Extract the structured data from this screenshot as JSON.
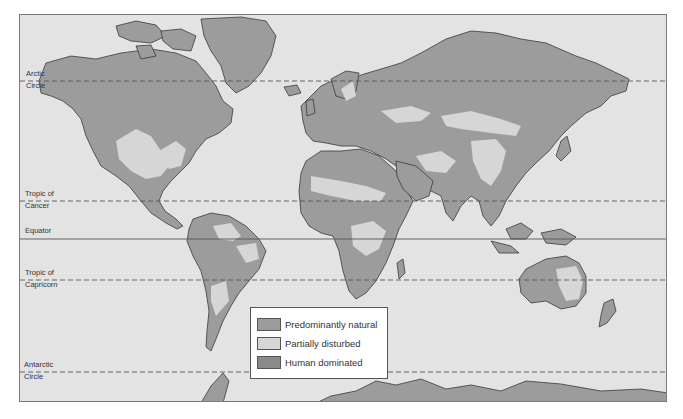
{
  "map": {
    "title": "World map of human disturbance of ecosystems",
    "colors": {
      "ocean": "#e3e3e3",
      "predominantly_natural": "#9c9c9c",
      "partially_disturbed": "#d6d6d6",
      "human_dominated": "#8a8a8a",
      "coastline": "#3a3a3a",
      "lines": "#555555"
    },
    "latitude_lines": [
      {
        "id": "arctic",
        "label_line1": "Arctic",
        "label_line2": "Circle",
        "y": 80,
        "style": "dashed"
      },
      {
        "id": "cancer",
        "label_line1": "Tropic of",
        "label_line2": "Cancer",
        "y": 200,
        "style": "dashed"
      },
      {
        "id": "equator",
        "label_line1": "Equator",
        "label_line2": "",
        "y": 238,
        "style": "solid"
      },
      {
        "id": "capricorn",
        "label_line1": "Tropic of",
        "label_line2": "Capricorn",
        "y": 279,
        "style": "dashed"
      },
      {
        "id": "antarctic",
        "label_line1": "Antarctic",
        "label_line2": "Circle",
        "y": 371,
        "style": "dashed"
      }
    ]
  },
  "legend": {
    "items": [
      {
        "label": "Predominantly natural",
        "color": "#9c9c9c"
      },
      {
        "label": "Partially disturbed",
        "color": "#d6d6d6"
      },
      {
        "label": "Human dominated",
        "color": "#8a8a8a"
      }
    ]
  }
}
